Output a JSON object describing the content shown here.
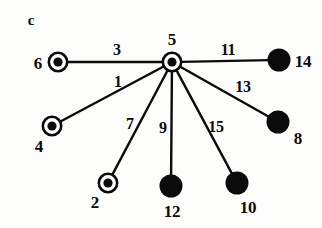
{
  "figure": {
    "panel_label": "c",
    "panel_label_pos": {
      "x": 31,
      "y": 20
    },
    "background_color": "#fdfdfb",
    "ink_color": "#0b0b0b"
  },
  "graph": {
    "type": "star-graph",
    "hub_id": "5",
    "node_styles": {
      "ring": {
        "description": "open circle with filled center dot",
        "outer_r": 10.5,
        "ring_stroke": 2.6,
        "inner_r": 4.6
      },
      "solid": {
        "description": "solid filled disc",
        "r": 11.5
      }
    },
    "nodes": [
      {
        "id": "5",
        "label": "5",
        "style": "ring",
        "x": 172,
        "y": 62,
        "label_x": 172,
        "label_y": 39
      },
      {
        "id": "6",
        "label": "6",
        "style": "ring",
        "x": 58,
        "y": 62,
        "label_x": 38,
        "label_y": 63
      },
      {
        "id": "4",
        "label": "4",
        "style": "ring",
        "x": 52,
        "y": 126,
        "label_x": 39,
        "label_y": 146
      },
      {
        "id": "2",
        "label": "2",
        "style": "ring",
        "x": 108,
        "y": 183,
        "label_x": 95,
        "label_y": 202
      },
      {
        "id": "14",
        "label": "14",
        "style": "solid",
        "x": 279,
        "y": 60,
        "label_x": 303,
        "label_y": 61
      },
      {
        "id": "8",
        "label": "8",
        "style": "solid",
        "x": 278,
        "y": 122,
        "label_x": 298,
        "label_y": 138
      },
      {
        "id": "12",
        "label": "12",
        "style": "solid",
        "x": 171,
        "y": 186,
        "label_x": 172,
        "label_y": 211
      },
      {
        "id": "10",
        "label": "10",
        "style": "solid",
        "x": 237,
        "y": 183,
        "label_x": 248,
        "label_y": 207
      }
    ],
    "edges": [
      {
        "id": "e3",
        "label": "3",
        "from": "5",
        "to": "6",
        "label_x": 117,
        "label_y": 50
      },
      {
        "id": "e1",
        "label": "1",
        "from": "5",
        "to": "4",
        "label_x": 118,
        "label_y": 82
      },
      {
        "id": "e7",
        "label": "7",
        "from": "5",
        "to": "2",
        "label_x": 130,
        "label_y": 124
      },
      {
        "id": "e9",
        "label": "9",
        "from": "5",
        "to": "12",
        "label_x": 163,
        "label_y": 128
      },
      {
        "id": "e15",
        "label": "15",
        "from": "5",
        "to": "10",
        "label_x": 216,
        "label_y": 127
      },
      {
        "id": "e13",
        "label": "13",
        "from": "5",
        "to": "8",
        "label_x": 243,
        "label_y": 87
      },
      {
        "id": "e11",
        "label": "11",
        "from": "5",
        "to": "14",
        "label_x": 228,
        "label_y": 50
      }
    ]
  }
}
